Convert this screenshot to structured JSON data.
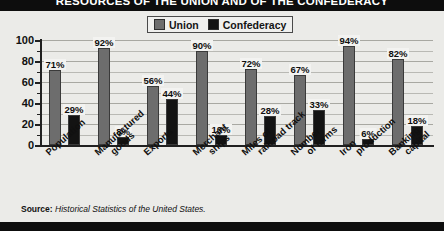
{
  "title": "RESOURCES OF THE UNION AND OF THE CONFEDERACY",
  "legend": {
    "items": [
      {
        "label": "Union",
        "color": "#6d6d6d"
      },
      {
        "label": "Confederacy",
        "color": "#131313"
      }
    ]
  },
  "source": {
    "label": "Source:",
    "text": "Historical Statistics of the United States."
  },
  "chart_data": {
    "type": "bar",
    "title": "RESOURCES OF THE UNION AND OF THE CONFEDERACY",
    "xlabel": "",
    "ylabel": "",
    "ylim": [
      0,
      100
    ],
    "yticks": [
      0,
      20,
      40,
      60,
      80,
      100
    ],
    "ytick_labels": [
      "0",
      "20",
      "40",
      "60",
      "80",
      "100"
    ],
    "minor_tick_interval": 10,
    "grid": true,
    "grid_axis": "y",
    "legend_position": "top-center",
    "value_label_suffix": "%",
    "categories": [
      "Population",
      "Manufactured goods",
      "Exports",
      "Merchant ships",
      "Miles of railroad track",
      "Number of farms",
      "Iron production",
      "Banking capital"
    ],
    "category_lines": [
      [
        "Population",
        ""
      ],
      [
        "Manufactured",
        "goods"
      ],
      [
        "Exports",
        ""
      ],
      [
        "Merchant",
        "ships"
      ],
      [
        "Miles of",
        "railroad track"
      ],
      [
        "Number",
        "of farms"
      ],
      [
        "Iron",
        "production"
      ],
      [
        "Banking",
        "capital"
      ]
    ],
    "series": [
      {
        "name": "Union",
        "color": "#6d6d6d",
        "values": [
          71,
          92,
          56,
          90,
          72,
          67,
          94,
          82
        ],
        "labels": [
          "71%",
          "92%",
          "56%",
          "90%",
          "72%",
          "67%",
          "94%",
          "82%"
        ]
      },
      {
        "name": "Confederacy",
        "color": "#131313",
        "values": [
          29,
          8,
          44,
          10,
          28,
          33,
          6,
          18
        ],
        "labels": [
          "29%",
          "8%",
          "44%",
          "10%",
          "28%",
          "33%",
          "6%",
          "18%"
        ]
      }
    ]
  }
}
